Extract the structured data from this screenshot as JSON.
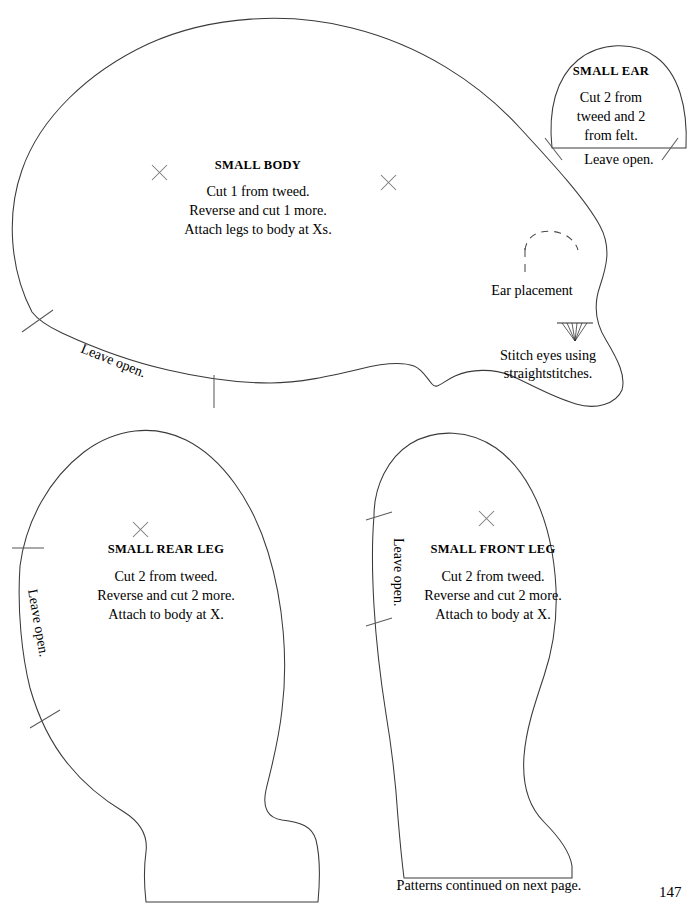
{
  "page": {
    "number": "147",
    "footer_note": "Patterns continued on next page."
  },
  "pieces": [
    {
      "id": "small-body",
      "title": "SMALL BODY",
      "instructions": [
        "Cut 1 from tweed.",
        "Reverse and cut 1 more.",
        "Attach legs to body at Xs."
      ],
      "leave_open": "Leave open.",
      "annotations": [
        {
          "id": "ear-placement",
          "text": "Ear placement"
        },
        {
          "id": "stitch-eyes",
          "text": "Stitch eyes using\nstraightstitches."
        }
      ],
      "stitch_eyes_line1": "Stitch eyes using",
      "stitch_eyes_line2": "straightstitches."
    },
    {
      "id": "small-ear",
      "title": "SMALL EAR",
      "instructions": [
        "Cut 2 from",
        "tweed and 2",
        "from felt."
      ],
      "leave_open": "Leave open."
    },
    {
      "id": "small-rear-leg",
      "title": "SMALL REAR LEG",
      "instructions": [
        "Cut 2 from tweed.",
        "Reverse and cut 2 more.",
        "Attach to body at X."
      ],
      "leave_open": "Leave open."
    },
    {
      "id": "small-front-leg",
      "title": "SMALL FRONT LEG",
      "instructions": [
        "Cut 2 from tweed.",
        "Reverse and cut 2 more.",
        "Attach to body at X."
      ],
      "leave_open": "Leave open."
    }
  ],
  "colors": {
    "ink": "#000000",
    "outline": "#3a3a3a",
    "mark": "#7a7a7a",
    "paper": "#ffffff"
  }
}
